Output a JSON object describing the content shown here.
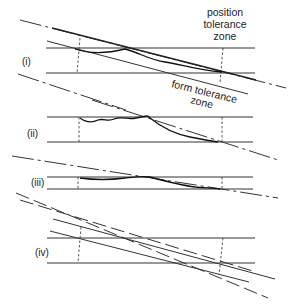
{
  "figure": {
    "labels": {
      "position_zone": [
        "position",
        "tolerance",
        "zone"
      ],
      "form_zone": [
        "form tolerance",
        "zone"
      ]
    },
    "panels": [
      {
        "id": "i",
        "label": "(i)"
      },
      {
        "id": "ii",
        "label": "(ii)"
      },
      {
        "id": "iii",
        "label": "(iii)"
      },
      {
        "id": "iv",
        "label": "(iv)"
      }
    ]
  }
}
